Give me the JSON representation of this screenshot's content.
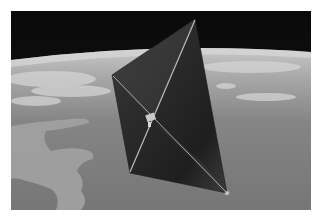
{
  "image": {
    "subject": "Solar sail spacecraft in orbit above Earth",
    "alt": "Illustration of a square solar sail with diagonal booms orbiting over Earth, clouds and coastline visible below, black space above the horizon",
    "palette": {
      "space": "#0c0c0c",
      "horizon_glow": "#bdbdbd",
      "clouds": "#cfcfcf",
      "ocean": "#7c7c7c",
      "land": "#9a9a9a",
      "sail": "#2c2c2c",
      "sail_highlight": "#5a5a5a",
      "booms": "#b8b8b8"
    }
  }
}
